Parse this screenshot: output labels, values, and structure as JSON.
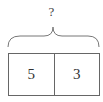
{
  "diagram": {
    "type": "bar-model",
    "total_label": "?",
    "parts": [
      {
        "label": "5"
      },
      {
        "label": "3"
      }
    ],
    "colors": {
      "stroke": "#666666",
      "text": "#333333",
      "background": "#ffffff"
    }
  }
}
